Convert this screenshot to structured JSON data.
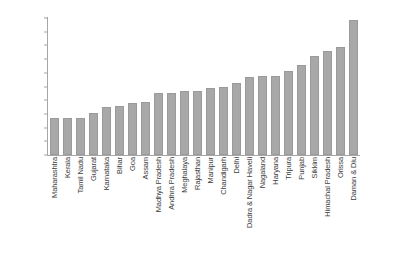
{
  "chart_data": {
    "type": "bar",
    "title": "",
    "subtitle": "",
    "xlabel": "",
    "ylabel": "",
    "ylim": [
      0,
      100
    ],
    "grid": false,
    "legend": false,
    "y_tick_labels": [
      "100%",
      "90%",
      "80%",
      "70%",
      "60%",
      "50%",
      "40%",
      "30%",
      "20%",
      "10%",
      "0%"
    ],
    "y_tick_values": [
      100,
      90,
      80,
      70,
      60,
      50,
      40,
      30,
      20,
      10,
      0
    ],
    "bar_color": "#a8a8a8",
    "axis_color": "#a6a6a6",
    "text_color": "#3d3d3d",
    "categories": [
      "Maharashtra",
      "Kerala",
      "Tamil Nadu",
      "Gujarat",
      "Karnataka",
      "Bihar",
      "Goa",
      "Assam",
      "Madhya Pradesh",
      "Andhra Pradesh",
      "Meghalaya",
      "Rajasthan",
      "Manipur",
      "Chandigarh",
      "Delhi",
      "Dadra & Nagar Haveli",
      "Nagaland",
      "Haryana",
      "Tripura",
      "Punjab",
      "Sikkim",
      "Himachal Pradesh",
      "Orissa",
      "Daman & Diu"
    ],
    "values": [
      27,
      27,
      27,
      31,
      35,
      36,
      38,
      39,
      45,
      45.5,
      47,
      47,
      49,
      49.5,
      52.5,
      57,
      57.5,
      57.5,
      61,
      66,
      72,
      76,
      79,
      98.5
    ]
  }
}
